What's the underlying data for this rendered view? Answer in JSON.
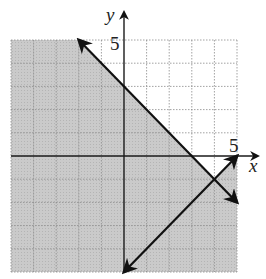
{
  "chart_data": {
    "type": "line",
    "title": "",
    "xlabel": "x",
    "ylabel": "y",
    "xlim": [
      -5,
      5
    ],
    "ylim": [
      -5,
      5
    ],
    "grid": true,
    "grid_step": 1,
    "tick_labels": {
      "x": [
        "5"
      ],
      "y": [
        "5"
      ]
    },
    "series": [
      {
        "name": "boundary-1",
        "equation": "x + y = 3",
        "style": "solid",
        "points": [
          [
            -2,
            5
          ],
          [
            5,
            -2
          ]
        ],
        "arrows": "both"
      },
      {
        "name": "boundary-2",
        "equation": "y = x - 5",
        "style": "solid",
        "points": [
          [
            0,
            -5
          ],
          [
            5,
            0
          ]
        ],
        "arrows": "both"
      }
    ],
    "shaded_region": {
      "description": "shaded: x + y <= 3 or y <= x - 5; unshaded: region above both lines",
      "unshaded_polygon": [
        [
          -2,
          5
        ],
        [
          5,
          5
        ],
        [
          5,
          0
        ],
        [
          4,
          -1
        ]
      ],
      "color": "#c8c8c8"
    }
  },
  "labels": {
    "x_axis": "x",
    "y_axis": "y",
    "x_tick": "5",
    "y_tick": "5"
  },
  "colors": {
    "shade": "#c8c8c8",
    "grid": "#8a8a8a",
    "axis": "#1a1a1a",
    "line": "#111111",
    "background": "#ffffff"
  }
}
